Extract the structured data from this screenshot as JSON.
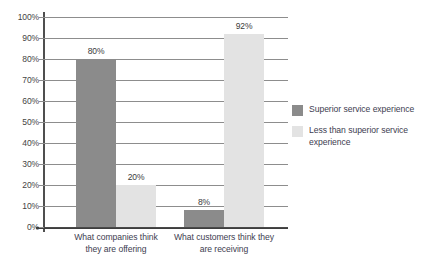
{
  "page": {
    "clipped_top_text": "",
    "clipped_bottom_text": ""
  },
  "chart_data": {
    "type": "bar",
    "title": "",
    "xlabel": "",
    "ylabel": "",
    "ylim": [
      0,
      100
    ],
    "grid": true,
    "legend_position": "right",
    "categories": [
      "What companies think they are offering",
      "What customers think they are receiving"
    ],
    "category_lines": [
      [
        "What companies think",
        "they are offering"
      ],
      [
        "What customers think they",
        "are receiving"
      ]
    ],
    "ytick_labels": [
      "0%",
      "10%",
      "20%",
      "30%",
      "40%",
      "50%",
      "60%",
      "70%",
      "80%",
      "90%",
      "100%"
    ],
    "ytick_values": [
      0,
      10,
      20,
      30,
      40,
      50,
      60,
      70,
      80,
      90,
      100
    ],
    "series": [
      {
        "name": "Superior service experience",
        "color": "#8b8b8b",
        "values": [
          80,
          8
        ],
        "labels": [
          "80%",
          "8%"
        ]
      },
      {
        "name": "Less than superior service experience",
        "color": "#e3e3e3",
        "values": [
          20,
          92
        ],
        "labels": [
          "20%",
          "92%"
        ]
      }
    ],
    "legend": [
      {
        "label": "Superior service experience",
        "color": "#8b8b8b",
        "lines": [
          "Superior service experience"
        ]
      },
      {
        "label": "Less than superior service experience",
        "color": "#e3e3e3",
        "lines": [
          "Less than superior service",
          "experience"
        ]
      }
    ]
  }
}
